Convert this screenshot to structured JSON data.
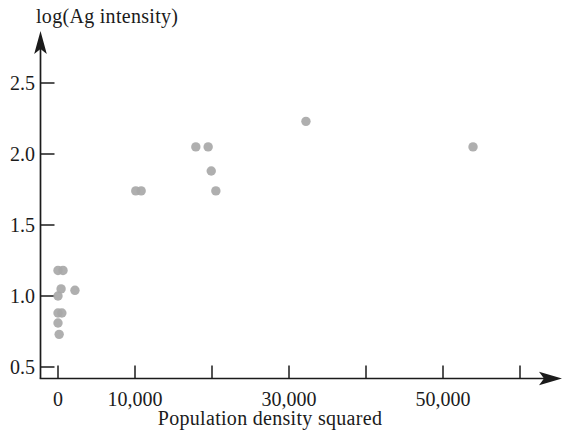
{
  "chart_data": {
    "type": "scatter",
    "title": "",
    "ylabel": "log(Ag intensity)",
    "xlabel": "Population density squared",
    "xlim": [
      0,
      62000
    ],
    "ylim": [
      0.5,
      2.5
    ],
    "grid": false,
    "legend": null,
    "axis_color": "#1b1b1b",
    "point_color": "#a8a8a8",
    "background_color": "#ffffff",
    "x_ticks": [
      {
        "value": 0,
        "label": "0"
      },
      {
        "value": 10000,
        "label": "10,000"
      },
      {
        "value": 20000,
        "label": ""
      },
      {
        "value": 30000,
        "label": "30,000"
      },
      {
        "value": 40000,
        "label": ""
      },
      {
        "value": 50000,
        "label": "50,000"
      },
      {
        "value": 60000,
        "label": ""
      }
    ],
    "y_ticks": [
      {
        "value": 0.5,
        "label": "0.5"
      },
      {
        "value": 1.0,
        "label": "1.0"
      },
      {
        "value": 1.5,
        "label": "1.5"
      },
      {
        "value": 2.0,
        "label": "2.0"
      },
      {
        "value": 2.5,
        "label": "2.5"
      }
    ],
    "points": [
      {
        "x": 0,
        "y": 1.18
      },
      {
        "x": 650,
        "y": 1.18
      },
      {
        "x": 400,
        "y": 1.05
      },
      {
        "x": 2200,
        "y": 1.04
      },
      {
        "x": 0,
        "y": 1.0
      },
      {
        "x": 0,
        "y": 0.88
      },
      {
        "x": 500,
        "y": 0.88
      },
      {
        "x": 0,
        "y": 0.81
      },
      {
        "x": 150,
        "y": 0.73
      },
      {
        "x": 10100,
        "y": 1.74
      },
      {
        "x": 10800,
        "y": 1.74
      },
      {
        "x": 17900,
        "y": 2.05
      },
      {
        "x": 19500,
        "y": 2.05
      },
      {
        "x": 19900,
        "y": 1.88
      },
      {
        "x": 20500,
        "y": 1.74
      },
      {
        "x": 32200,
        "y": 2.23
      },
      {
        "x": 53900,
        "y": 2.05
      }
    ]
  }
}
